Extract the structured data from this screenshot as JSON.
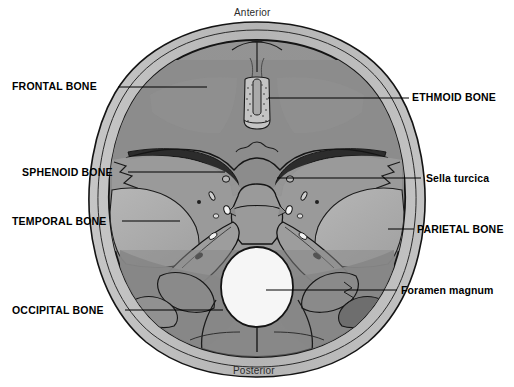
{
  "figure": {
    "orientation": {
      "anterior": "Anterior",
      "posterior": "Posterior"
    },
    "colors": {
      "background": "#ffffff",
      "outer_rim": "#b9b9b9",
      "outline": "#1a1a1a",
      "anterior_fossa": "#8d8d8d",
      "middle_fossa": "#9a9a9a",
      "posterior_fossa": "#858585",
      "temporal_light": "#b0b0b0",
      "sphenoid_body": "#9e9e9e",
      "foramen_magnum": "#f2f2f2",
      "dark_accent": "#2f2f2f",
      "leader_line": "#000000",
      "label_text": "#000000"
    },
    "labels_left": [
      {
        "id": "frontal-bone",
        "text": "FRONTAL BONE",
        "case": "caps",
        "x": 12,
        "y": 81,
        "leader_x1": 118,
        "leader_x2": 207,
        "leader_y": 87
      },
      {
        "id": "sphenoid-bone",
        "text": "SPHENOID BONE",
        "case": "caps",
        "x": 22,
        "y": 167,
        "leader_x1": 128,
        "leader_x2": 225,
        "leader_y": 172
      },
      {
        "id": "temporal-bone",
        "text": "TEMPORAL BONE",
        "case": "caps",
        "x": 12,
        "y": 216,
        "leader_x1": 122,
        "leader_x2": 180,
        "leader_y": 221
      },
      {
        "id": "occipital-bone",
        "text": "OCCIPITAL BONE",
        "case": "caps",
        "x": 12,
        "y": 305,
        "leader_x1": 125,
        "leader_x2": 223,
        "leader_y": 310
      }
    ],
    "labels_right": [
      {
        "id": "ethmoid-bone",
        "text": "ETHMOID BONE",
        "case": "caps",
        "x": 412,
        "y": 92,
        "leader_x1": 268,
        "leader_x2": 409,
        "leader_y": 98
      },
      {
        "id": "sella-turcica",
        "text": "Sella turcica",
        "case": "mixed",
        "x": 426,
        "y": 173,
        "leader_x1": 277,
        "leader_x2": 421,
        "leader_y": 178
      },
      {
        "id": "parietal-bone",
        "text": "PARIETAL BONE",
        "case": "caps",
        "x": 417,
        "y": 224,
        "leader_x1": 388,
        "leader_x2": 414,
        "leader_y": 229
      },
      {
        "id": "foramen-magnum",
        "text": "Foramen magnum",
        "case": "mixed",
        "x": 401,
        "y": 285,
        "leader_x1": 266,
        "leader_x2": 397,
        "leader_y": 290
      }
    ],
    "structures": [
      "frontal crest",
      "crista galli",
      "cribriform plate of ethmoid",
      "lesser wing of sphenoid",
      "greater wing of sphenoid",
      "sella turcica",
      "optic canal",
      "foramen rotundum",
      "foramen ovale",
      "foramen spinosum",
      "petrous ridge of temporal bone",
      "internal acoustic meatus",
      "jugular foramen",
      "foramen magnum",
      "occipital bone",
      "parietal bone"
    ]
  }
}
